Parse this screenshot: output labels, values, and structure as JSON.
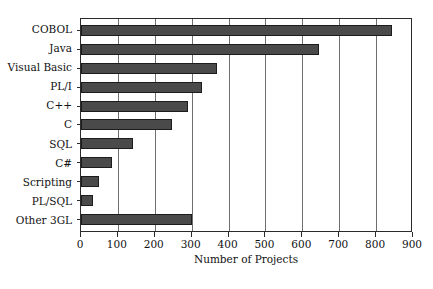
{
  "chart_data": {
    "type": "bar",
    "orientation": "horizontal",
    "title": "",
    "subtitle": "",
    "xlabel": "Number of Projects",
    "ylabel": "",
    "categories": [
      "COBOL",
      "Java",
      "Visual Basic",
      "PL/I",
      "C++",
      "C",
      "SQL",
      "C#",
      "Scripting",
      "PL/SQL",
      "Other 3GL"
    ],
    "values": [
      843,
      646,
      370,
      327,
      290,
      247,
      141,
      84,
      49,
      33,
      300
    ],
    "xlim": [
      0,
      900
    ],
    "xticks": [
      0,
      100,
      200,
      300,
      400,
      500,
      600,
      700,
      800,
      900
    ],
    "xtick_labels": [
      "0",
      "100",
      "200",
      "300",
      "400",
      "500",
      "600",
      "700",
      "800",
      "900"
    ],
    "grid": "vertical",
    "legend": "none",
    "bar_color": "#4a4a4a",
    "bar_border_color": "#1c1c1c",
    "axis_color": "#2b2b2b",
    "gridline_color": "#6f6f6f",
    "background_color": "#ffffff"
  }
}
